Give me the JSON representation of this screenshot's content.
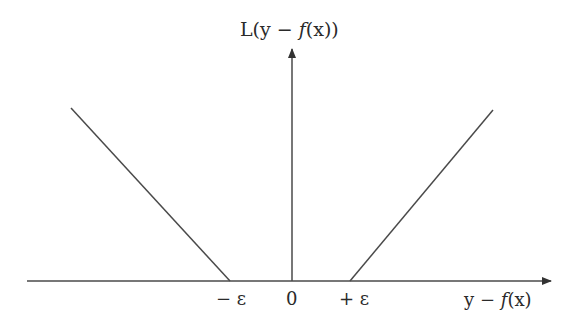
{
  "diagram": {
    "type": "epsilon-insensitive loss function",
    "y_axis_label": {
      "prefix": "L(y − ",
      "func": "f",
      "suffix": "(x))"
    },
    "x_axis_label": {
      "prefix": "y − ",
      "func": "f",
      "suffix": "(x)"
    },
    "tick_labels": {
      "neg_epsilon": "− ε",
      "zero": "0",
      "pos_epsilon": "+ ε"
    },
    "colors": {
      "line": "#4a4a4a",
      "text": "#2a2a2a",
      "background": "#ffffff"
    }
  }
}
